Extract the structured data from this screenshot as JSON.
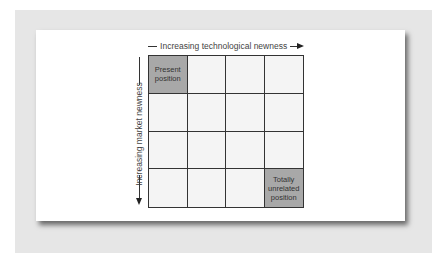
{
  "diagram": {
    "top_axis_label": "Increasing technological newness",
    "left_axis_label": "Increasing market newness",
    "rows": 4,
    "columns": 4,
    "highlight_color": "#a8a8a8",
    "cells": [
      {
        "row": 1,
        "col": 1,
        "label": "Present position",
        "highlighted": true
      },
      {
        "row": 1,
        "col": 2,
        "label": "",
        "highlighted": false
      },
      {
        "row": 1,
        "col": 3,
        "label": "",
        "highlighted": false
      },
      {
        "row": 1,
        "col": 4,
        "label": "",
        "highlighted": false
      },
      {
        "row": 2,
        "col": 1,
        "label": "",
        "highlighted": false
      },
      {
        "row": 2,
        "col": 2,
        "label": "",
        "highlighted": false
      },
      {
        "row": 2,
        "col": 3,
        "label": "",
        "highlighted": false
      },
      {
        "row": 2,
        "col": 4,
        "label": "",
        "highlighted": false
      },
      {
        "row": 3,
        "col": 1,
        "label": "",
        "highlighted": false
      },
      {
        "row": 3,
        "col": 2,
        "label": "",
        "highlighted": false
      },
      {
        "row": 3,
        "col": 3,
        "label": "",
        "highlighted": false
      },
      {
        "row": 3,
        "col": 4,
        "label": "",
        "highlighted": false
      },
      {
        "row": 4,
        "col": 1,
        "label": "",
        "highlighted": false
      },
      {
        "row": 4,
        "col": 2,
        "label": "",
        "highlighted": false
      },
      {
        "row": 4,
        "col": 3,
        "label": "",
        "highlighted": false
      },
      {
        "row": 4,
        "col": 4,
        "label": "Totally unrelated position",
        "highlighted": true
      }
    ]
  }
}
